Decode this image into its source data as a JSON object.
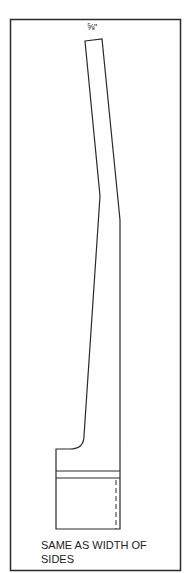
{
  "diagram": {
    "dimension_label": "⅝\"",
    "caption_line1": "SAME AS WIDTH OF",
    "caption_line2": "SIDES",
    "colors": {
      "line": "#2a2a2a",
      "background": "#ffffff"
    }
  }
}
